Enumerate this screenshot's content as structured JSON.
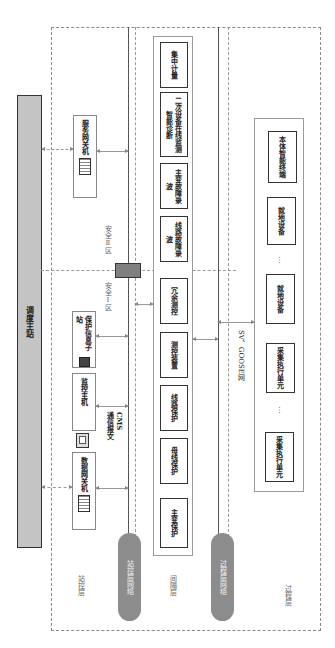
{
  "main_station": {
    "label": "调度主站"
  },
  "layers": {
    "station": "站控层",
    "bay": "间隔层",
    "process": "过程层"
  },
  "networks": {
    "station_network": "站控层网络",
    "process_network": "过程层网络",
    "sv_goose": "SV、GOOSE网"
  },
  "zones": {
    "zone1": "安全Ⅰ区",
    "zone2": "安全Ⅱ区"
  },
  "station_devices": {
    "data_gateway": "数据网关机",
    "monitor_host": "监控主机",
    "cms_note": "CMS\n通信报文",
    "protection_substation": "保护信息子站",
    "service_gateway": "服务网关机"
  },
  "bay_devices": [
    {
      "label": "主变保护"
    },
    {
      "label": "母线保护"
    },
    {
      "label": "线路保护"
    },
    {
      "label": "测控装置"
    },
    {
      "label": "冗余测控"
    },
    {
      "label": "线路故障录波"
    },
    {
      "label": "主变故障录波"
    },
    {
      "label": "二次设备在线监测智能诊断"
    },
    {
      "label": "集中计量"
    }
  ],
  "process_devices": [
    {
      "label": "采集执行单元"
    },
    {
      "label": "…"
    },
    {
      "label": "采集执行单元"
    },
    {
      "label": "就地设备"
    },
    {
      "label": "…"
    },
    {
      "label": "就地设备"
    },
    {
      "label": "本体智能终端"
    }
  ],
  "icons": {
    "data_gateway_icon": "server-rack-icon",
    "monitor_icon": "monitor-icon",
    "protection_icon": "device-icon",
    "service_gateway_icon": "server-rack-icon",
    "firewall_icon": "firewall-icon"
  },
  "colors": {
    "main_bar": "#c4c4c4",
    "pill": "#8c8c8c",
    "firewall": "#7f7f7f",
    "dash": "#8a8a8a"
  }
}
